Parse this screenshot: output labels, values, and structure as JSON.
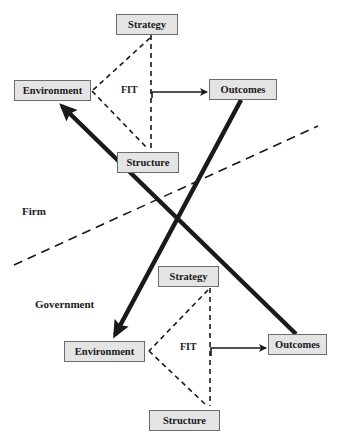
{
  "firm": {
    "region_label": "Firm",
    "strategy": "Strategy",
    "environment": "Environment",
    "structure": "Structure",
    "outcomes": "Outcomes",
    "fit": "FIT"
  },
  "government": {
    "region_label": "Government",
    "strategy": "Strategy",
    "environment": "Environment",
    "structure": "Structure",
    "outcomes": "Outcomes",
    "fit": "FIT"
  },
  "connections": [
    {
      "from": "firm.fit",
      "to": "firm.outcomes",
      "style": "solid-arrow"
    },
    {
      "from": "government.fit",
      "to": "government.outcomes",
      "style": "solid-arrow"
    },
    {
      "from": "government.outcomes",
      "to": "firm.environment",
      "style": "thick-arrow"
    },
    {
      "from": "firm.outcomes",
      "to": "government.environment",
      "style": "thick-arrow"
    },
    {
      "from": "firm.strategy",
      "to": "firm.environment",
      "style": "dashed"
    },
    {
      "from": "firm.structure",
      "to": "firm.environment",
      "style": "dashed"
    },
    {
      "from": "firm.strategy",
      "to": "firm.structure",
      "style": "dashed"
    },
    {
      "from": "government.strategy",
      "to": "government.environment",
      "style": "dashed"
    },
    {
      "from": "government.structure",
      "to": "government.environment",
      "style": "dashed"
    },
    {
      "from": "government.strategy",
      "to": "government.structure",
      "style": "dashed"
    }
  ],
  "colors": {
    "box_fill": "#e4e4e4",
    "box_border": "#6d6d6d",
    "line": "#1a1a1a"
  }
}
